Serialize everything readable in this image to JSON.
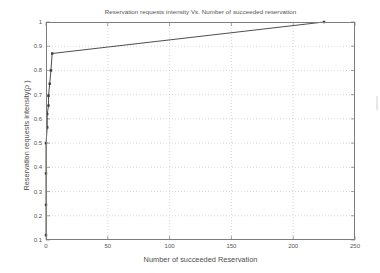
{
  "figure": {
    "background_color": "#ffffff",
    "axis_color": "#7d7d7a",
    "grid_color": "#bdbdb8",
    "line_color": "#3a3a38"
  },
  "chart_data": {
    "type": "line",
    "title": "Reservation requests intensity Vs. Number of succeeded reservation",
    "xlabel": "Number of succeeded Reservation",
    "ylabel": "Reservation requests intensity(ρ )",
    "xlim": [
      0,
      250
    ],
    "ylim": [
      0.1,
      1
    ],
    "grid": true,
    "legend": null,
    "xticks": [
      0,
      50,
      100,
      150,
      200,
      250
    ],
    "xtick_labels": [
      "0",
      "50",
      "100",
      "150",
      "200",
      "250"
    ],
    "yticks": [
      0.1,
      0.2,
      0.3,
      0.4,
      0.5,
      0.6,
      0.7,
      0.8,
      0.9,
      1
    ],
    "ytick_labels": [
      "0.1",
      "0.2",
      "0.3",
      "0.4",
      "0.5",
      "0.6",
      "0.7",
      "0.8",
      "0.9",
      "1"
    ],
    "marker": "square",
    "series": [
      {
        "name": "Reservation requests intensity",
        "x": [
          0,
          0,
          0,
          0,
          1,
          1,
          2,
          2,
          3,
          4,
          5,
          225
        ],
        "y": [
          0.12,
          0.245,
          0.375,
          0.5,
          0.565,
          0.62,
          0.655,
          0.695,
          0.745,
          0.8,
          0.87,
          1.0
        ]
      }
    ]
  }
}
